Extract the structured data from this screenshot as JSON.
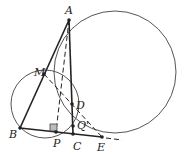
{
  "diagram": {
    "title": "",
    "points": {
      "A": {
        "label": "A",
        "x": 69,
        "y": 20
      },
      "M": {
        "label": "M",
        "x": 44,
        "y": 74
      },
      "B": {
        "label": "B",
        "x": 20,
        "y": 128
      },
      "P": {
        "label": "P",
        "x": 56,
        "y": 132
      },
      "C": {
        "label": "C",
        "x": 73,
        "y": 134
      },
      "D": {
        "label": "D",
        "x": 72,
        "y": 104
      },
      "Q": {
        "label": "Q'",
        "x": 73,
        "y": 126
      },
      "E": {
        "label": "E",
        "x": 102,
        "y": 137
      }
    },
    "circles": [
      {
        "name": "large-circle",
        "cx": 115,
        "cy": 72,
        "r": 61
      },
      {
        "name": "small-circle",
        "cx": 45,
        "cy": 104,
        "r": 34
      }
    ],
    "colors": {
      "stroke": "#333333",
      "circle": "#555555",
      "right_angle_fill": "#bbbbbb"
    }
  }
}
